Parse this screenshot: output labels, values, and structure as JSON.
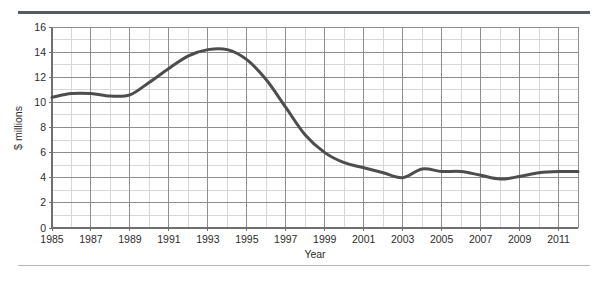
{
  "chart_data": {
    "type": "line",
    "title": "",
    "xlabel": "Year",
    "ylabel": "$ millions",
    "xlim": [
      1985,
      2012
    ],
    "ylim": [
      0,
      16
    ],
    "yticks": [
      0,
      2,
      4,
      6,
      8,
      10,
      12,
      14,
      16
    ],
    "xticks": [
      1985,
      1987,
      1989,
      1991,
      1993,
      1995,
      1997,
      1999,
      2001,
      2003,
      2005,
      2007,
      2009,
      2011
    ],
    "xtick_labels": [
      "1985",
      "1987",
      "1989",
      "1991",
      "1993",
      "1995",
      "1997",
      "1999",
      "2001",
      "2003",
      "2005",
      "2007",
      "2009",
      "2011"
    ],
    "ytick_labels": [
      "0",
      "2",
      "4",
      "6",
      "8",
      "10",
      "12",
      "14",
      "16"
    ],
    "grid": true,
    "grid_minor": true,
    "legend": "none",
    "line_color": "#4d4d4d",
    "grid_major_color": "#8e8e8e",
    "grid_minor_color": "#d7d7d7",
    "x": [
      1985,
      1986,
      1987,
      1988,
      1989,
      1990,
      1991,
      1992,
      1993,
      1994,
      1995,
      1996,
      1997,
      1998,
      1999,
      2000,
      2001,
      2002,
      2003,
      2004,
      2005,
      2006,
      2007,
      2008,
      2009,
      2010,
      2011,
      2012
    ],
    "values": [
      10.4,
      10.7,
      10.7,
      10.5,
      10.6,
      11.6,
      12.7,
      13.7,
      14.2,
      14.2,
      13.4,
      11.8,
      9.6,
      7.4,
      6.0,
      5.2,
      4.8,
      4.4,
      4.0,
      4.7,
      4.5,
      4.5,
      4.2,
      3.9,
      4.1,
      4.4,
      4.5,
      4.5
    ],
    "series": [
      {
        "name": "",
        "values": [
          10.4,
          10.7,
          10.7,
          10.5,
          10.6,
          11.6,
          12.7,
          13.7,
          14.2,
          14.2,
          13.4,
          11.8,
          9.6,
          7.4,
          6.0,
          5.2,
          4.8,
          4.4,
          4.0,
          4.7,
          4.5,
          4.5,
          4.2,
          3.9,
          4.1,
          4.4,
          4.5,
          4.5
        ]
      }
    ]
  },
  "layout": {
    "plot_left": 52,
    "plot_right": 578,
    "plot_top": 27,
    "plot_bottom": 228
  }
}
